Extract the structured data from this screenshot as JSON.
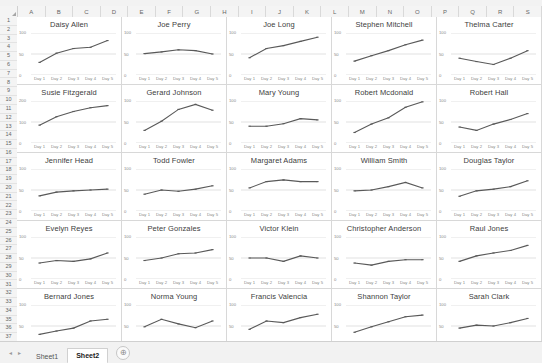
{
  "app": {
    "type": "spreadsheet",
    "columns": [
      "A",
      "B",
      "C",
      "D",
      "E",
      "F",
      "G",
      "H",
      "I",
      "J",
      "K",
      "L",
      "M",
      "N",
      "O",
      "P",
      "Q",
      "R",
      "S"
    ],
    "rows": [
      1,
      2,
      3,
      4,
      5,
      6,
      7,
      8,
      9,
      10,
      11,
      12,
      13,
      14,
      15,
      16,
      17,
      18,
      19,
      20,
      21,
      22,
      23,
      24,
      25,
      26,
      27,
      28,
      29,
      30,
      31,
      32,
      33,
      34,
      35,
      36,
      37
    ],
    "select_all_icon": "select-all-triangle-icon"
  },
  "tabbar": {
    "prev_icon": "◂",
    "next_icon": "▸",
    "tabs": [
      {
        "label": "Sheet1",
        "active": false
      },
      {
        "label": "Sheet2",
        "active": true
      }
    ],
    "add_sheet_label": "⊕"
  },
  "chart_data": {
    "type": "line",
    "x": [
      "Day 1",
      "Day 2",
      "Day 3",
      "Day 4",
      "Day 5"
    ],
    "xlabel": "",
    "ylabel": "",
    "grid": true,
    "legend": "none",
    "layout": "small-multiples 5x5",
    "yticks_default": [
      0,
      50,
      100
    ],
    "charts": [
      {
        "title": "Daisy Allen",
        "values": [
          30,
          52,
          63,
          66,
          82
        ],
        "ylim": [
          0,
          100
        ],
        "yticks": [
          0,
          50,
          100
        ]
      },
      {
        "title": "Joe Perry",
        "values": [
          51,
          55,
          60,
          58,
          50
        ],
        "ylim": [
          0,
          100
        ],
        "yticks": [
          0,
          50,
          100
        ]
      },
      {
        "title": "Joe Long",
        "values": [
          41,
          63,
          70,
          80,
          90
        ],
        "ylim": [
          0,
          100
        ],
        "yticks": [
          0,
          50,
          100
        ]
      },
      {
        "title": "Stephen Mitchell",
        "values": [
          33,
          46,
          58,
          72,
          83
        ],
        "ylim": [
          0,
          100
        ],
        "yticks": [
          0,
          50,
          100
        ]
      },
      {
        "title": "Thelma Carter",
        "values": [
          40,
          32,
          25,
          40,
          58
        ],
        "ylim": [
          0,
          100
        ],
        "yticks": [
          0,
          50,
          100
        ]
      },
      {
        "title": "Susie Fitzgerald",
        "values": [
          85,
          125,
          150,
          168,
          178
        ],
        "ylim": [
          0,
          200
        ],
        "yticks": [
          0,
          100,
          200
        ]
      },
      {
        "title": "Gerard Johnson",
        "values": [
          30,
          52,
          80,
          92,
          78
        ],
        "ylim": [
          0,
          100
        ],
        "yticks": [
          0,
          50,
          100
        ]
      },
      {
        "title": "Mary Young",
        "values": [
          40,
          40,
          46,
          58,
          55
        ],
        "ylim": [
          0,
          100
        ],
        "yticks": [
          0,
          50,
          100
        ]
      },
      {
        "title": "Robert Mcdonald",
        "values": [
          25,
          45,
          60,
          85,
          98
        ],
        "ylim": [
          0,
          100
        ],
        "yticks": [
          0,
          50,
          100
        ]
      },
      {
        "title": "Robert Hall",
        "values": [
          38,
          30,
          45,
          56,
          70
        ],
        "ylim": [
          0,
          100
        ],
        "yticks": [
          0,
          50,
          100
        ]
      },
      {
        "title": "Jennifer Head",
        "values": [
          36,
          45,
          48,
          50,
          52
        ],
        "ylim": [
          0,
          100
        ],
        "yticks": [
          0,
          50,
          100
        ]
      },
      {
        "title": "Todd Fowler",
        "values": [
          40,
          50,
          47,
          52,
          60
        ],
        "ylim": [
          0,
          100
        ],
        "yticks": [
          0,
          50,
          100
        ]
      },
      {
        "title": "Margaret Adams",
        "values": [
          55,
          70,
          74,
          70,
          70
        ],
        "ylim": [
          0,
          100
        ],
        "yticks": [
          0,
          50,
          100
        ]
      },
      {
        "title": "William Smith",
        "values": [
          48,
          50,
          58,
          68,
          55
        ],
        "ylim": [
          0,
          100
        ],
        "yticks": [
          0,
          50,
          100
        ]
      },
      {
        "title": "Douglas Taylor",
        "values": [
          35,
          48,
          52,
          58,
          72
        ],
        "ylim": [
          0,
          100
        ],
        "yticks": [
          0,
          50,
          100
        ]
      },
      {
        "title": "Evelyn Reyes",
        "values": [
          38,
          44,
          42,
          48,
          62
        ],
        "ylim": [
          0,
          100
        ],
        "yticks": [
          0,
          50,
          100
        ]
      },
      {
        "title": "Peter Gonzales",
        "values": [
          44,
          50,
          60,
          62,
          70
        ],
        "ylim": [
          0,
          100
        ],
        "yticks": [
          0,
          50,
          100
        ]
      },
      {
        "title": "Victor Klein",
        "values": [
          50,
          50,
          42,
          55,
          50
        ],
        "ylim": [
          0,
          100
        ],
        "yticks": [
          0,
          50,
          100
        ]
      },
      {
        "title": "Christopher Anderson",
        "values": [
          38,
          33,
          42,
          46,
          46
        ],
        "ylim": [
          0,
          100
        ],
        "yticks": [
          0,
          50,
          100
        ]
      },
      {
        "title": "Raul Jones",
        "values": [
          42,
          55,
          62,
          68,
          80
        ],
        "ylim": [
          0,
          100
        ],
        "yticks": [
          0,
          50,
          100
        ]
      },
      {
        "title": "Bernard Jones",
        "values": [
          30,
          38,
          45,
          62,
          66
        ],
        "ylim": [
          0,
          100
        ],
        "yticks": [
          0,
          50,
          100
        ]
      },
      {
        "title": "Norma Young",
        "values": [
          48,
          66,
          55,
          46,
          62
        ],
        "ylim": [
          0,
          100
        ],
        "yticks": [
          0,
          50,
          100
        ]
      },
      {
        "title": "Francis Valencia",
        "values": [
          42,
          62,
          58,
          70,
          78
        ],
        "ylim": [
          0,
          100
        ],
        "yticks": [
          0,
          50,
          100
        ]
      },
      {
        "title": "Shannon Taylor",
        "values": [
          35,
          48,
          60,
          72,
          76
        ],
        "ylim": [
          0,
          100
        ],
        "yticks": [
          0,
          50,
          100
        ]
      },
      {
        "title": "Sarah Clark",
        "values": [
          45,
          52,
          50,
          58,
          68
        ],
        "ylim": [
          0,
          100
        ],
        "yticks": [
          0,
          50,
          100
        ]
      }
    ],
    "series_color": "#595959",
    "marker_color": "#595959",
    "gridline_color": "#d9d9d9"
  }
}
